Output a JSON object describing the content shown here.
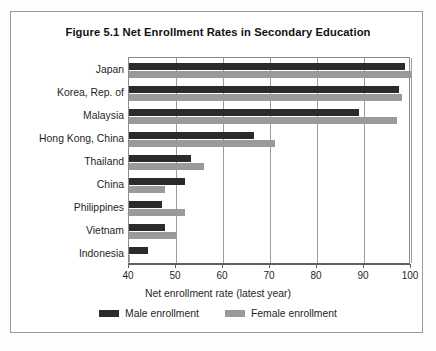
{
  "figure": {
    "title": "Figure 5.1 Net Enrollment Rates in Secondary Education"
  },
  "axis": {
    "x_title": "Net enrollment rate (latest year)",
    "ticks": [
      "40",
      "50",
      "60",
      "70",
      "80",
      "90",
      "100"
    ]
  },
  "legend": {
    "items": [
      {
        "label": "Male enrollment",
        "color": "#2b2b2b"
      },
      {
        "label": "Female enrollment",
        "color": "#9a9a9a"
      }
    ]
  },
  "colors": {
    "male": "#2b2b2b",
    "female": "#9a9a9a",
    "grid": "#9d9d9d",
    "frame": "#9a9a9a",
    "background": "#ffffff"
  },
  "chart_data": {
    "type": "bar",
    "orientation": "horizontal",
    "title": "Figure 5.1 Net Enrollment Rates in Secondary Education",
    "xlabel": "Net enrollment rate (latest year)",
    "ylabel": "",
    "xlim": [
      40,
      100
    ],
    "xticks": [
      40,
      50,
      60,
      70,
      80,
      90,
      100
    ],
    "grid": true,
    "legend_position": "bottom",
    "categories": [
      "Japan",
      "Korea, Rep. of",
      "Malaysia",
      "Hong Kong, China",
      "Thailand",
      "China",
      "Philippines",
      "Vietnam",
      "Indonesia"
    ],
    "series": [
      {
        "name": "Male enrollment",
        "color": "#2b2b2b",
        "values": [
          98.7,
          97.4,
          89.0,
          66.6,
          53.2,
          52.0,
          47.0,
          47.7,
          44.0
        ]
      },
      {
        "name": "Female enrollment",
        "color": "#9a9a9a",
        "values": [
          100.0,
          98.0,
          97.0,
          71.0,
          56.0,
          47.6,
          52.0,
          50.0,
          40.3
        ]
      }
    ]
  }
}
